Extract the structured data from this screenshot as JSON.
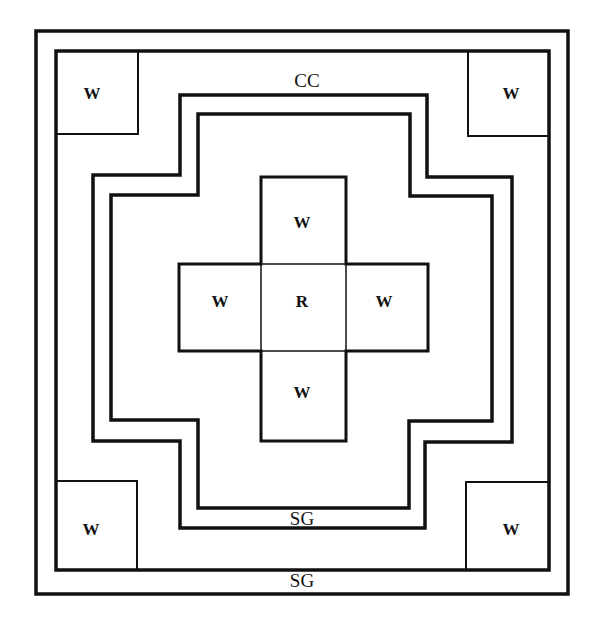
{
  "diagram": {
    "type": "concentric plan diagram",
    "colors": {
      "line": "#111111",
      "background": "#ffffff"
    },
    "labels": {
      "corner_tl": "W",
      "corner_tr": "W",
      "corner_bl": "W",
      "corner_br": "W",
      "center": "R",
      "cross_top": "W",
      "cross_left": "W",
      "cross_right": "W",
      "cross_bottom": "W",
      "cc": "CC",
      "sg_inner": "SG",
      "sg_outer": "SG"
    }
  }
}
